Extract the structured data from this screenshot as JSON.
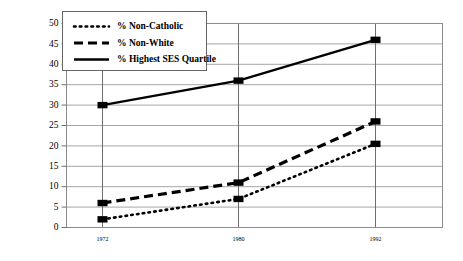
{
  "chart_data": {
    "type": "line",
    "title": "",
    "subtitle": "",
    "xlabel": "",
    "ylabel": "",
    "categories": [
      "1972",
      "1980",
      "1992"
    ],
    "x": [
      1972,
      1980,
      1992
    ],
    "xlim": [
      1970,
      1996
    ],
    "ylim": [
      0,
      50
    ],
    "ytick_step": 5,
    "yticks": [
      0,
      5,
      10,
      15,
      20,
      25,
      30,
      35,
      40,
      45,
      50
    ],
    "ytick_labels": [
      "0",
      "5",
      "10",
      "15",
      "20",
      "25",
      "30",
      "35",
      "40",
      "45",
      "50"
    ],
    "xticks": [
      1972,
      1980,
      1992
    ],
    "xtick_labels": [
      "1972",
      "1980",
      "1992"
    ],
    "grid": true,
    "grid_orientation": "both",
    "legend_position": "top-left",
    "series": [
      {
        "name": "% Non-Catholic",
        "style": "dotted",
        "marker": "square",
        "color": "#000000",
        "values": [
          2,
          7,
          20.5
        ]
      },
      {
        "name": "% Non-White",
        "style": "dashed",
        "marker": "square",
        "color": "#000000",
        "values": [
          6,
          11,
          26
        ]
      },
      {
        "name": "% Highest SES Quartile",
        "style": "solid",
        "marker": "square",
        "color": "#000000",
        "values": [
          30,
          36,
          46
        ]
      }
    ]
  },
  "legend": {
    "items": [
      {
        "label": "% Non-Catholic",
        "style": "dotted"
      },
      {
        "label": "% Non-White",
        "style": "dashed"
      },
      {
        "label": "% Highest SES Quartile",
        "style": "solid"
      }
    ]
  },
  "colors": {
    "ink": "#000000",
    "gridline": "#a6a6a6",
    "vgridline": "#6e6e6e",
    "border": "#8c8c8c",
    "background": "#ffffff"
  }
}
